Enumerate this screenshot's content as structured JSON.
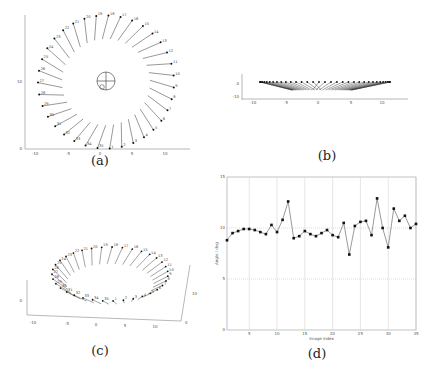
{
  "figure": {
    "captions": {
      "a": "(a)",
      "b": "(b)",
      "c": "(c)",
      "d": "(d)"
    },
    "panel_a": {
      "type": "camera-positions-top-view",
      "x_ticks": [
        "-10",
        "-5",
        "0",
        "5",
        "10"
      ],
      "y_ticks": [
        "10",
        "0"
      ],
      "camera_labels": [
        "1",
        "2",
        "3",
        "4",
        "5",
        "6",
        "7",
        "8",
        "9",
        "10",
        "11",
        "12",
        "13",
        "14",
        "15",
        "16",
        "17",
        "18",
        "19",
        "20",
        "21",
        "22",
        "23",
        "24",
        "25",
        "26",
        "27",
        "28",
        "29",
        "30",
        "31",
        "32",
        "33",
        "34",
        "35"
      ]
    },
    "panel_b": {
      "type": "camera-positions-side-view",
      "x_ticks": [
        "-10",
        "-5",
        "0",
        "5",
        "10"
      ],
      "y_ticks": [
        "0",
        "-10"
      ]
    },
    "panel_c": {
      "type": "camera-positions-3d-view",
      "x_ticks": [
        "-10",
        "-5",
        "0",
        "5",
        "10"
      ],
      "y_ticks": [
        "10",
        "0"
      ],
      "z_ticks": [
        "0"
      ]
    }
  },
  "chart_data": {
    "type": "line",
    "title": "",
    "xlabel": "Image index",
    "ylabel": "Angle / deg",
    "xlim": [
      1,
      35
    ],
    "ylim": [
      0,
      15
    ],
    "x_ticks": [
      5,
      10,
      15,
      20,
      25,
      30,
      35
    ],
    "y_ticks": [
      0,
      5,
      10,
      15
    ],
    "grid": true,
    "x": [
      1,
      2,
      3,
      4,
      5,
      6,
      7,
      8,
      9,
      10,
      11,
      12,
      13,
      14,
      15,
      16,
      17,
      18,
      19,
      20,
      21,
      22,
      23,
      24,
      25,
      26,
      27,
      28,
      29,
      30,
      31,
      32,
      33,
      34,
      35
    ],
    "series": [
      {
        "name": "angle",
        "values": [
          8.8,
          9.5,
          9.7,
          9.9,
          9.9,
          9.8,
          9.6,
          9.4,
          10.3,
          9.6,
          10.8,
          12.6,
          9.0,
          9.2,
          9.7,
          9.4,
          9.2,
          9.5,
          9.8,
          9.3,
          9.1,
          10.5,
          7.4,
          10.2,
          10.6,
          10.7,
          9.3,
          12.9,
          10.0,
          8.1,
          11.9,
          10.7,
          11.2,
          10.0,
          10.4
        ]
      }
    ]
  }
}
